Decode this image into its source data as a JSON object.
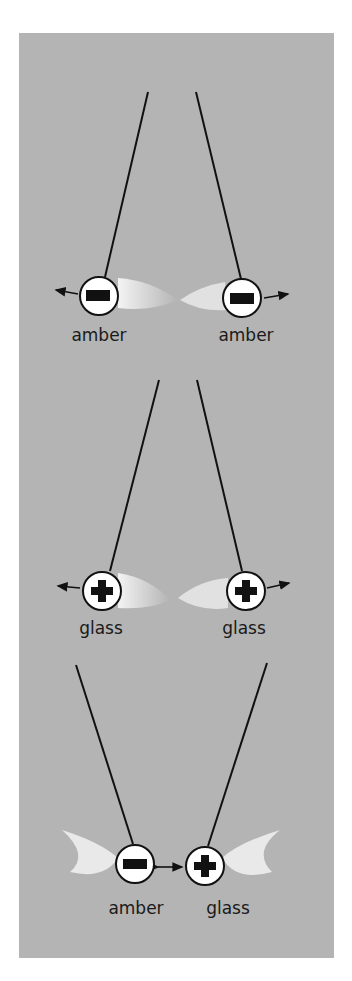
{
  "figure": {
    "background_color": "#b4b4b4",
    "ball_fill": "#ffffff",
    "ink_color": "#111111",
    "panels": [
      {
        "id": "amber-amber",
        "interaction": "repel",
        "balls": [
          {
            "label": "amber",
            "charge": "negative",
            "symbol": "minus-icon"
          },
          {
            "label": "amber",
            "charge": "negative",
            "symbol": "minus-icon"
          }
        ]
      },
      {
        "id": "glass-glass",
        "interaction": "repel",
        "balls": [
          {
            "label": "glass",
            "charge": "positive",
            "symbol": "plus-icon"
          },
          {
            "label": "glass",
            "charge": "positive",
            "symbol": "plus-icon"
          }
        ]
      },
      {
        "id": "amber-glass",
        "interaction": "attract",
        "balls": [
          {
            "label": "amber",
            "charge": "negative",
            "symbol": "minus-icon"
          },
          {
            "label": "glass",
            "charge": "positive",
            "symbol": "plus-icon"
          }
        ]
      }
    ]
  }
}
